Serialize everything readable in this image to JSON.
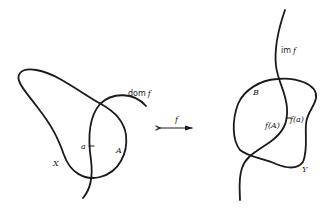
{
  "diagram": {
    "left_set": {
      "set_label": "X",
      "subset_label": "A",
      "point_label": "a",
      "domain_label_prefix": "dom",
      "domain_label_fn": "f"
    },
    "mapping": {
      "arrow_label": "f"
    },
    "right_set": {
      "set_label": "Y",
      "subset_label": "B",
      "image_prefix": "im",
      "image_fn": "f",
      "point_image_label": "f(a)",
      "subset_image_label": "f(A)"
    },
    "colors": {
      "stroke": "#1a1a1a",
      "background": "#ffffff"
    }
  }
}
